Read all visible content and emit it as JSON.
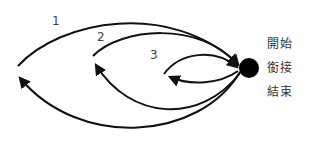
{
  "diagram": {
    "colors": {
      "stroke": "#111111",
      "hub": "#000000",
      "text": "#333333"
    },
    "loops": [
      {
        "id": "loop-1",
        "label": "1"
      },
      {
        "id": "loop-2",
        "label": "2"
      },
      {
        "id": "loop-3",
        "label": "3"
      }
    ],
    "hub": {
      "name": "hub-node"
    },
    "states": [
      {
        "label": "開始"
      },
      {
        "label": "銜接"
      },
      {
        "label": "結束"
      }
    ]
  }
}
